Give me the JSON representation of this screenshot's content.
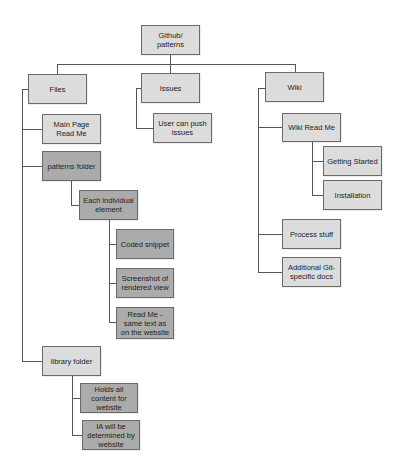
{
  "diagram": {
    "type": "hierarchy-tree",
    "colors": {
      "light_box": "#dcdcdc",
      "dark_box": "#ababab",
      "border": "#6a6a6a",
      "connector": "#555555"
    },
    "root": {
      "label": "Github/ patterns"
    },
    "files": {
      "label": "Files",
      "main_page": "Main Page Read Me",
      "patterns_folder": "patterns folder",
      "each_element": "Each individual element",
      "coded_snippet": "Coded snippet",
      "screenshot": "Screenshot of rendered view",
      "readme_text": "Read Me - same text as on the website",
      "library_folder": "library folder",
      "holds_all": "Holds all content for website",
      "ia": "IA will be determined by website"
    },
    "issues": {
      "label": "Issues",
      "push": "User can push issues"
    },
    "wiki": {
      "label": "Wiki",
      "readme": "Wiki Read Me",
      "getting_started": "Getting Started",
      "installation": "Installation",
      "process": "Process stuff",
      "additional": "Additional Git-specific docs"
    }
  }
}
